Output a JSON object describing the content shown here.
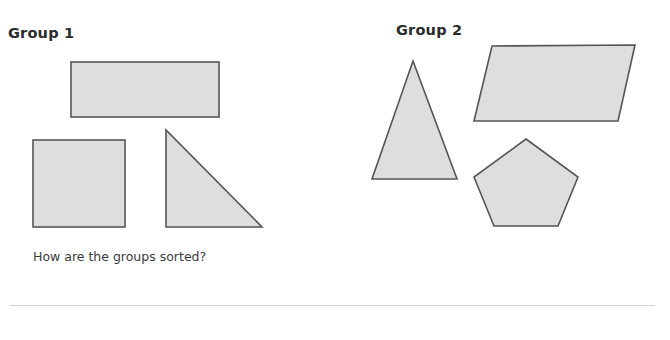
{
  "page": {
    "background_color": "#ffffff"
  },
  "groups": [
    {
      "id": "group-1",
      "label": "Group 1"
    },
    {
      "id": "group-2",
      "label": "Group 2"
    }
  ],
  "question": {
    "text": "How are the groups sorted?"
  },
  "divider": {
    "color": "#d3d3d3"
  },
  "style": {
    "shape_fill": "#dedede",
    "shape_stroke": "#555555",
    "shape_stroke_width": 1.6,
    "heading_color": "#2b2b2b",
    "question_color": "#3a3a3a"
  },
  "shapes": {
    "group_1": [
      {
        "name": "rectangle",
        "type": "rect",
        "x": 71,
        "y": 62,
        "width": 148,
        "height": 55
      },
      {
        "name": "square",
        "type": "rect",
        "x": 33,
        "y": 140,
        "width": 92,
        "height": 87
      },
      {
        "name": "right-triangle",
        "type": "polygon",
        "points": "166,130 166,227 262,227"
      }
    ],
    "group_2": [
      {
        "name": "isosceles-triangle",
        "type": "polygon",
        "points": "413,61 457,179 372,179"
      },
      {
        "name": "parallelogram",
        "type": "polygon",
        "points": "492,46 635,45 618,121 474,121"
      },
      {
        "name": "pentagon",
        "type": "polygon",
        "points": "526,139 578,177 558,226 494,226 474,177"
      }
    ]
  }
}
